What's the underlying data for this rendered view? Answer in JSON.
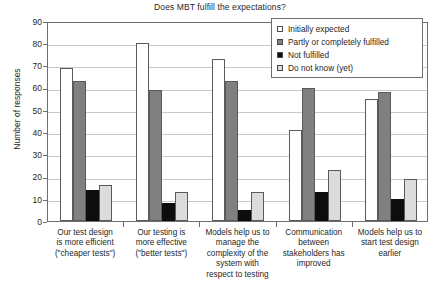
{
  "chart_data": {
    "type": "bar",
    "title": "Does MBT fulfill the expectations?",
    "xlabel": "",
    "ylabel": "Number of responses",
    "ylim": [
      0,
      90
    ],
    "ytick_labels": [
      "0",
      "10",
      "20",
      "30",
      "40",
      "50",
      "60",
      "70",
      "80",
      "90"
    ],
    "yticks": [
      0,
      10,
      20,
      30,
      40,
      50,
      60,
      70,
      80,
      90
    ],
    "grid": true,
    "legend_position": "top-right",
    "categories": [
      "Our test design is more efficient (\"cheaper tests\")",
      "Our testing is more effective (\"better tests\")",
      "Models help us to manage the complexity of the system with respect to testing",
      "Communication between stakeholders has improved",
      "Models help us to start test design earlier"
    ],
    "category_lines": [
      [
        "Our test design",
        "is more efficient",
        "(\"cheaper tests\")"
      ],
      [
        "Our testing is",
        "more effective",
        "(\"better tests\")"
      ],
      [
        "Models help us to",
        "manage the",
        "complexity of the",
        "system with",
        "respect to testing"
      ],
      [
        "Communication",
        "between",
        "stakeholders has",
        "improved"
      ],
      [
        "Models help us to",
        "start test design",
        "earlier"
      ]
    ],
    "series": [
      {
        "name": "Initially expected",
        "color": "#ffffff",
        "values": [
          69,
          80,
          73,
          41,
          55
        ]
      },
      {
        "name": "Partly or completely fulfilled",
        "color": "#808080",
        "values": [
          63,
          59,
          63,
          60,
          58
        ]
      },
      {
        "name": "Not fulfilled",
        "color": "#0d0d0d",
        "values": [
          14,
          8,
          5,
          13,
          10
        ]
      },
      {
        "name": "Do not know (yet)",
        "color": "#dcdcdc",
        "values": [
          16,
          13,
          13,
          23,
          19
        ]
      }
    ]
  },
  "legend": {
    "items": [
      {
        "label": "Initially expected",
        "swatch": "legend-swatch-white"
      },
      {
        "label": "Partly or completely fulfilled",
        "swatch": "legend-swatch-gray"
      },
      {
        "label": "Not fulfilled",
        "swatch": "legend-swatch-black"
      },
      {
        "label": "Do not know (yet)",
        "swatch": "legend-swatch-lightgray"
      }
    ]
  }
}
